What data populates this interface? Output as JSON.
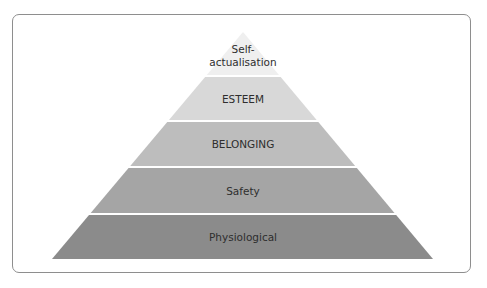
{
  "diagram": {
    "title": "",
    "type": "pyramid",
    "apex": {
      "x": 243,
      "y": 32
    },
    "base": {
      "left": 52,
      "right": 433,
      "y": 259
    },
    "gap": 2,
    "layers": [
      {
        "label_lines": [
          "Self-",
          "actualisation"
        ],
        "y_top": 32,
        "y_bottom": 75,
        "color": "#efefef"
      },
      {
        "label_lines": [
          "ESTEEM"
        ],
        "y_top": 77,
        "y_bottom": 120,
        "color": "#d8d8d8"
      },
      {
        "label_lines": [
          "BELONGING"
        ],
        "y_top": 122,
        "y_bottom": 166,
        "color": "#bdbdbd"
      },
      {
        "label_lines": [
          "Safety"
        ],
        "y_top": 168,
        "y_bottom": 213,
        "color": "#a5a5a5"
      },
      {
        "label_lines": [
          "Physiological"
        ],
        "y_top": 215,
        "y_bottom": 259,
        "color": "#8b8b8b"
      }
    ]
  },
  "labels": {
    "self_actualisation": "Self-actualisation",
    "esteem": "ESTEEM",
    "belonging": "BELONGING",
    "safety": "Safety",
    "physiological": "Physiological"
  }
}
